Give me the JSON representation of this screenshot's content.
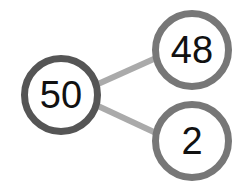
{
  "diagram": {
    "type": "number-bond",
    "whole": {
      "value": "50",
      "ring_color": "#555555"
    },
    "parts": [
      {
        "value": "48",
        "ring_color": "#777777"
      },
      {
        "value": "2",
        "ring_color": "#777777"
      }
    ],
    "connector_color": "#aaaaaa"
  }
}
